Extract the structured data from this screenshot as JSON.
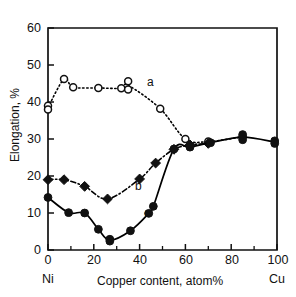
{
  "chart_data": {
    "type": "scatter",
    "title": "",
    "xlabel": "Copper content, atom%",
    "ylabel": "Elongation, %",
    "xlim": [
      0,
      100
    ],
    "ylim": [
      0,
      60
    ],
    "xticks": [
      0,
      20,
      40,
      60,
      80,
      100
    ],
    "yticks": [
      0,
      10,
      20,
      30,
      40,
      50,
      60
    ],
    "xminorticks": [
      10,
      30,
      50,
      70,
      90
    ],
    "grid": false,
    "legend_position": "inline-annotations",
    "axis_endpoint_labels": {
      "left": "Ni",
      "right": "Cu"
    },
    "annotations": [
      {
        "text": "a",
        "x": 44,
        "y": 43.5
      },
      {
        "text": "b",
        "x": 39,
        "y": 18.5
      },
      {
        "text": "c",
        "x": 43,
        "y": 11.0
      }
    ],
    "series": [
      {
        "name": "a",
        "label": "a",
        "marker": "open-circle",
        "linestyle": "dotted",
        "color": "#000000",
        "points": [
          {
            "x": 0,
            "y": 39.0
          },
          {
            "x": 0,
            "y": 38.0
          },
          {
            "x": 7,
            "y": 46.2
          },
          {
            "x": 11,
            "y": 44.0
          },
          {
            "x": 22,
            "y": 43.8
          },
          {
            "x": 32,
            "y": 43.7
          },
          {
            "x": 35,
            "y": 45.6
          },
          {
            "x": 35,
            "y": 43.4
          },
          {
            "x": 49,
            "y": 38.2
          },
          {
            "x": 60,
            "y": 30.0
          },
          {
            "x": 70,
            "y": 29.3
          },
          {
            "x": 85,
            "y": 30.6
          }
        ]
      },
      {
        "name": "b",
        "label": "b",
        "marker": "filled-diamond",
        "linestyle": "dash-dot",
        "color": "#000000",
        "points": [
          {
            "x": 0,
            "y": 19.0
          },
          {
            "x": 7,
            "y": 19.0
          },
          {
            "x": 16,
            "y": 17.2
          },
          {
            "x": 26,
            "y": 13.8
          },
          {
            "x": 40,
            "y": 19.2
          },
          {
            "x": 47,
            "y": 23.5
          },
          {
            "x": 55,
            "y": 27.2
          },
          {
            "x": 62,
            "y": 28.4
          },
          {
            "x": 70,
            "y": 28.8
          }
        ]
      },
      {
        "name": "c",
        "label": "c",
        "marker": "filled-circle",
        "linestyle": "solid",
        "color": "#000000",
        "points": [
          {
            "x": 0,
            "y": 14.2
          },
          {
            "x": 9,
            "y": 10.1
          },
          {
            "x": 16,
            "y": 10.0
          },
          {
            "x": 22,
            "y": 5.6
          },
          {
            "x": 27,
            "y": 2.9
          },
          {
            "x": 27,
            "y": 2.4
          },
          {
            "x": 36,
            "y": 5.2
          },
          {
            "x": 44,
            "y": 9.9
          },
          {
            "x": 46,
            "y": 11.8
          },
          {
            "x": 55,
            "y": 27.3
          },
          {
            "x": 62,
            "y": 27.8
          },
          {
            "x": 71,
            "y": 29.0
          },
          {
            "x": 85,
            "y": 31.2
          },
          {
            "x": 85,
            "y": 29.8
          },
          {
            "x": 99,
            "y": 29.5
          },
          {
            "x": 99,
            "y": 28.8
          }
        ]
      }
    ]
  },
  "axis": {
    "y_title": "Elongation, %",
    "x_title": "Copper content, atom%",
    "left_end": "Ni",
    "right_end": "Cu",
    "ytick_labels": [
      "60",
      "50",
      "40",
      "30",
      "20",
      "10",
      "0"
    ],
    "xtick_labels": [
      "0",
      "20",
      "40",
      "60",
      "80",
      "100"
    ]
  },
  "labels": {
    "a": "a",
    "b": "b",
    "c": "c"
  }
}
